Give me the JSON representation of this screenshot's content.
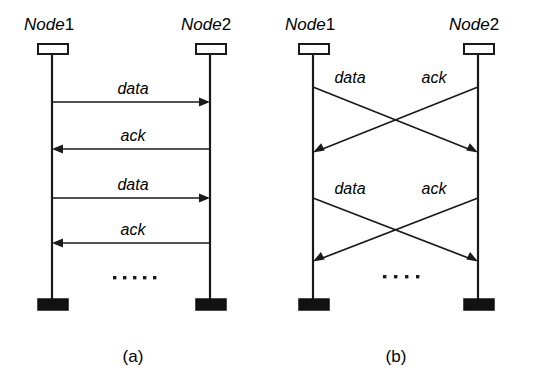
{
  "figure": {
    "title": "",
    "background_color": "#ffffff",
    "ink_color": "#1a1a1a"
  },
  "panels": [
    {
      "id": "panel-a",
      "caption": "(a)",
      "caption_x": 133,
      "caption_y": 362,
      "left_node": {
        "label_node": "Node",
        "label_index": "1",
        "label_x": 24,
        "label_y": 30,
        "lifeline_x": 52,
        "lifeline_top": 54,
        "lifeline_bottom": 300,
        "top_box": {
          "x": 38,
          "y": 44,
          "w": 30,
          "h": 10,
          "filled": false
        },
        "bottom_box": {
          "x": 38,
          "y": 299,
          "w": 30,
          "h": 11,
          "filled": true
        }
      },
      "right_node": {
        "label_node": "Node",
        "label_index": "2",
        "label_x": 181,
        "label_y": 30,
        "lifeline_x": 210,
        "lifeline_top": 54,
        "lifeline_bottom": 300,
        "top_box": {
          "x": 196,
          "y": 44,
          "w": 30,
          "h": 10,
          "filled": false
        },
        "bottom_box": {
          "x": 196,
          "y": 299,
          "w": 30,
          "h": 11,
          "filled": true
        }
      },
      "messages": [
        {
          "label": "data",
          "direction": "right",
          "y": 102,
          "label_x": 133,
          "label_y": 94
        },
        {
          "label": "ack",
          "direction": "left",
          "y": 149,
          "label_x": 133,
          "label_y": 141
        },
        {
          "label": "data",
          "direction": "right",
          "y": 198,
          "label_x": 133,
          "label_y": 190
        },
        {
          "label": "ack",
          "direction": "left",
          "y": 243,
          "label_x": 133,
          "label_y": 235
        }
      ],
      "ellipsis": {
        "count": 5,
        "start_x": 113,
        "spacing": 10,
        "y": 278,
        "size": 3
      }
    },
    {
      "id": "panel-b",
      "caption": "(b)",
      "caption_x": 396,
      "caption_y": 362,
      "left_node": {
        "label_node": "Node",
        "label_index": "1",
        "label_x": 285,
        "label_y": 30,
        "lifeline_x": 313,
        "lifeline_top": 54,
        "lifeline_bottom": 300,
        "top_box": {
          "x": 299,
          "y": 44,
          "w": 30,
          "h": 10,
          "filled": false
        },
        "bottom_box": {
          "x": 299,
          "y": 299,
          "w": 30,
          "h": 11,
          "filled": true
        }
      },
      "right_node": {
        "label_node": "Node",
        "label_index": "2",
        "label_x": 449,
        "label_y": 30,
        "lifeline_x": 478,
        "lifeline_top": 54,
        "lifeline_bottom": 300,
        "top_box": {
          "x": 464,
          "y": 44,
          "w": 30,
          "h": 10,
          "filled": false
        },
        "bottom_box": {
          "x": 464,
          "y": 299,
          "w": 30,
          "h": 11,
          "filled": true
        }
      },
      "messages": [
        {
          "label": "data",
          "direction": "right-down",
          "y_start": 87,
          "y_end": 152,
          "label_x": 350,
          "label_y": 83
        },
        {
          "label": "ack",
          "direction": "left-down",
          "y_start": 87,
          "y_end": 152,
          "label_x": 434,
          "label_y": 83
        },
        {
          "label": "data",
          "direction": "right-down",
          "y_start": 198,
          "y_end": 261,
          "label_x": 350,
          "label_y": 194
        },
        {
          "label": "ack",
          "direction": "left-down",
          "y_start": 198,
          "y_end": 261,
          "label_x": 434,
          "label_y": 194
        }
      ],
      "ellipsis": {
        "count": 4,
        "start_x": 383,
        "spacing": 11,
        "y": 277,
        "size": 3
      }
    }
  ]
}
